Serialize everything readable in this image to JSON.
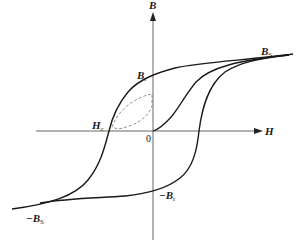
{
  "diagram": {
    "axes": {
      "x_label": "H",
      "y_label": "B",
      "origin_label": "0"
    },
    "labels": {
      "saturation_pos": {
        "main": "B",
        "sub": "S"
      },
      "saturation_neg": {
        "prefix": "−",
        "main": "B",
        "sub": "S"
      },
      "remanence_pos": {
        "main": "B",
        "sub": "r"
      },
      "remanence_neg": {
        "prefix": "−",
        "main": "B",
        "sub": "r"
      },
      "coercivity": {
        "main": "H",
        "sub": "c"
      }
    },
    "curves": [
      {
        "name": "initial magnetization curve",
        "style": "solid"
      },
      {
        "name": "descending branch (Bs → Br → Hc → -Bs)",
        "style": "solid"
      },
      {
        "name": "ascending branch (-Bs → -Br → +Hc → Bs)",
        "style": "solid"
      },
      {
        "name": "minor loop",
        "style": "dashed"
      }
    ],
    "colors": {
      "curve": "#1a1a1a",
      "axis": "#555555",
      "minor_loop": "#777777"
    }
  }
}
